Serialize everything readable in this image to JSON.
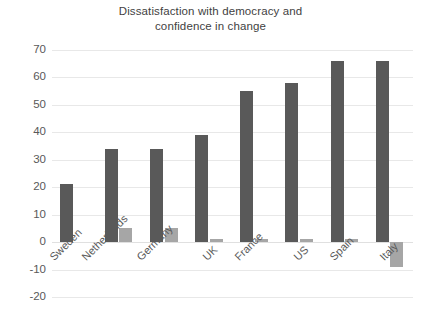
{
  "chart_data": {
    "type": "bar",
    "title": "Dissatisfaction with democracy and confidence in change",
    "title_lines": [
      "Dissatisfaction with democracy and",
      "confidence in change"
    ],
    "xlabel": "",
    "ylabel": "",
    "ylim": [
      -20,
      70
    ],
    "yticks": [
      70,
      60,
      50,
      40,
      30,
      20,
      10,
      0,
      -10,
      -20
    ],
    "ytick_labels": [
      "70",
      "60",
      "50",
      "40",
      "30",
      "20",
      "10",
      "0",
      "-10",
      "-20"
    ],
    "grid": true,
    "legend": "none",
    "categories": [
      "Sweden",
      "Netherlands",
      "Germany",
      "UK",
      "France",
      "US",
      "Spain",
      "Italy"
    ],
    "series": [
      {
        "name": "Dissatisfaction with democracy",
        "color": "#595959",
        "values": [
          21,
          34,
          34,
          39,
          55,
          58,
          66,
          66
        ]
      },
      {
        "name": "Confidence in change",
        "color": "#a6a6a6",
        "values": [
          0,
          5,
          5,
          1,
          1,
          1,
          1,
          -9
        ]
      }
    ]
  },
  "colors": {
    "series_dark": "#595959",
    "series_light": "#a6a6a6",
    "gridline": "#e8e8e8",
    "text": "#595959",
    "background": "#ffffff"
  }
}
